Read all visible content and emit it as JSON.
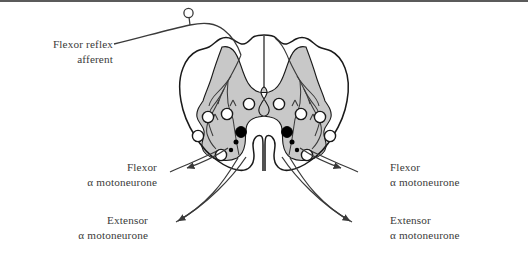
{
  "figure": {
    "type": "anatomical-diagram",
    "background_color": "#ffffff",
    "rule_color": "#5b5b5b",
    "gray_matter_color": "#c8c8c8",
    "outline_color": "#1a1a1a",
    "text_color": "#3a3a3a",
    "excitatory_marker_color": "#ffffff",
    "inhibitory_marker_color": "#000000"
  },
  "labels": {
    "afferent": {
      "line1": "Flexor reflex",
      "line2": "afferent"
    },
    "left_flexor": {
      "line1": "Flexor",
      "line2": "α motoneurone"
    },
    "left_extensor": {
      "line1": "Extensor",
      "line2": "α motoneurone"
    },
    "right_flexor": {
      "line1": "Flexor",
      "line2": "α motoneurone"
    },
    "right_extensor": {
      "line1": "Extensor",
      "line2": "α motoneurone"
    }
  },
  "legend_semantics": {
    "open_circle": "excitatory neuron / motoneurone cell body",
    "filled_circle": "inhibitory interneuron",
    "small_dot": "small interneuron terminal"
  }
}
